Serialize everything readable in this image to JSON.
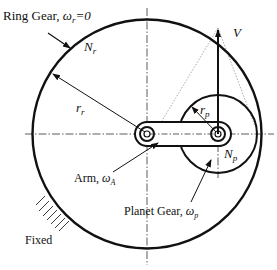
{
  "labels": {
    "ring_gear": "Ring Gear, ",
    "ring_omega": "ω",
    "ring_omega_sub": "r",
    "ring_omega_eq": "=0",
    "ring_teeth": "N",
    "ring_teeth_sub": "r",
    "ring_radius": "r",
    "ring_radius_sub": "r",
    "velocity": "V",
    "planet_radius": "r",
    "planet_radius_sub": "p",
    "planet_teeth": "N",
    "planet_teeth_sub": "p",
    "arm": "Arm, ",
    "arm_omega": "ω",
    "arm_omega_sub": "A",
    "planet_gear": "Planet Gear, ",
    "planet_omega": "ω",
    "planet_omega_sub": "p",
    "fixed": "Fixed"
  },
  "colors": {
    "stroke": "#111111",
    "background": "#ffffff"
  }
}
